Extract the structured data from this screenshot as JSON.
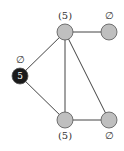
{
  "graph": {
    "nodes": [
      {
        "id": "top-middle",
        "x": 65,
        "y": 32,
        "fill": "#bfbfbf",
        "inner_label": "",
        "outer_label": "(5)",
        "label_dx": 0,
        "label_dy": -13
      },
      {
        "id": "top-right",
        "x": 109,
        "y": 32,
        "fill": "#bfbfbf",
        "inner_label": "",
        "outer_label": "∅",
        "label_dx": 0,
        "label_dy": -13
      },
      {
        "id": "left",
        "x": 20,
        "y": 76,
        "fill": "#1a1a1a",
        "inner_label": "5",
        "outer_label": "∅",
        "label_dx": 0,
        "label_dy": -13
      },
      {
        "id": "bottom-middle",
        "x": 65,
        "y": 120,
        "fill": "#bfbfbf",
        "inner_label": "",
        "outer_label": "(5)",
        "label_dx": 0,
        "label_dy": 19
      },
      {
        "id": "bottom-right",
        "x": 109,
        "y": 120,
        "fill": "#bfbfbf",
        "inner_label": "",
        "outer_label": "∅",
        "label_dx": 0,
        "label_dy": 19
      }
    ],
    "edges": [
      [
        "top-middle",
        "top-right"
      ],
      [
        "top-middle",
        "left"
      ],
      [
        "top-middle",
        "bottom-middle"
      ],
      [
        "top-middle",
        "bottom-right"
      ],
      [
        "left",
        "bottom-middle"
      ],
      [
        "bottom-middle",
        "bottom-right"
      ]
    ],
    "node_radius": 8,
    "edge_color": "#444444",
    "stroke_color": "#555555"
  }
}
